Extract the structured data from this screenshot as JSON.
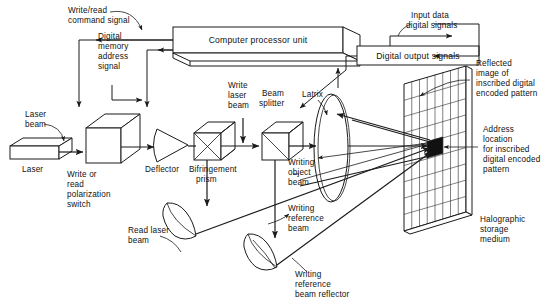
{
  "diagram": {
    "boxes": {
      "cpu": "Computer processor unit",
      "digital_output": "Digital output signals"
    },
    "labels": {
      "write_read_command": [
        "Write/read",
        "command  signal"
      ],
      "digital_memory_address": [
        "Digital",
        "memory",
        "address",
        "signal"
      ],
      "input_data_digital": [
        "Input data",
        "digital signals"
      ],
      "laser_beam": [
        "Laser",
        "beam"
      ],
      "laser": "Laser",
      "write_or_read_switch": [
        "Write or",
        "read",
        "polarization",
        "switch"
      ],
      "deflector": "Deflector",
      "bifringement_prism": [
        "Bifringement",
        "prism"
      ],
      "write_laser_beam": [
        "Write",
        "laser",
        "beam"
      ],
      "beam_splitter": [
        "Beam",
        "splitter"
      ],
      "latrix": "Latrix",
      "writing_object_beam": [
        "Writing",
        "object",
        "beam"
      ],
      "writing_reference_beam": [
        "Writing",
        "reference",
        "beam"
      ],
      "read_laser_beam": [
        "Read  laser",
        "beam"
      ],
      "writing_reference_beam_reflector": [
        "Writing",
        "reference",
        "beam  reflector"
      ],
      "reflected_image": [
        "Reflected",
        "image of",
        "inscribed digital",
        "encoded pattern"
      ],
      "address_location": [
        "Address",
        "location",
        "for inscribed",
        "digital encoded",
        "pattern"
      ],
      "halographic_storage_medium": [
        "Halographic",
        "storage",
        "medium"
      ]
    },
    "colors": {
      "ink": "#1a1a1a",
      "background": "#ffffff",
      "address_marker": "#111111"
    }
  }
}
